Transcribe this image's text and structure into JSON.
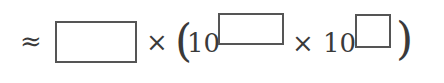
{
  "expression": {
    "approx": "≈",
    "times1": "×",
    "open_paren": "(",
    "base1": "10",
    "times2": "×",
    "base2": "10",
    "close_paren": ")"
  },
  "inputs": {
    "coefficient": {
      "value": ""
    },
    "exponent1": {
      "value": ""
    },
    "exponent2": {
      "value": ""
    }
  }
}
